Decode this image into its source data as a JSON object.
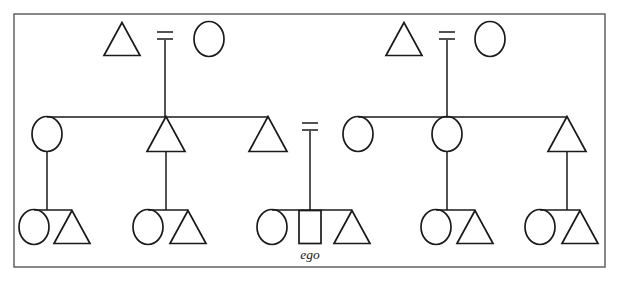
{
  "figure": {
    "type": "genealogical-kinship-chart",
    "background_color": "#ffffff",
    "ink_color": "#1a1a1a",
    "frame_color": "#58585a",
    "canvas": {
      "width": 619,
      "height": 281
    }
  },
  "frame": {
    "name": "figure-border",
    "x": 14,
    "y": 14,
    "width": 591,
    "height": 253
  },
  "legend_semantics": {
    "triangle": "male",
    "circle": "female",
    "square": "ego",
    "equals_sign": "marriage / union",
    "vertical_line": "descent",
    "horizontal_line": "sibling set"
  },
  "labels": [
    {
      "id": "ego-label",
      "text": "ego",
      "x": 310,
      "y": 259,
      "style": "italic-serif"
    }
  ],
  "generations": [
    {
      "id": "generation-1",
      "name": "grandparents-row",
      "baseline_y": 30,
      "shape_top_y": 22,
      "shape_bottom_y": 56
    },
    {
      "id": "generation-2",
      "name": "parents-row",
      "sibling_bar_y": 117,
      "shape_bottom_y": 152
    },
    {
      "id": "generation-3",
      "name": "ego-row",
      "sibling_bar_y": 210,
      "shape_bottom_y": 243
    }
  ],
  "nodes": [
    {
      "id": "n1",
      "shape": "triangle",
      "sex": "male",
      "generation": 1,
      "cx": 122,
      "cy": 39,
      "w": 36,
      "h": 33,
      "orientation": "up",
      "group": "left-ancestors"
    },
    {
      "id": "n2",
      "shape": "circle",
      "sex": "female",
      "generation": 1,
      "cx": 209,
      "cy": 39,
      "w": 30,
      "h": 35,
      "orientation": "none",
      "group": "left-ancestors"
    },
    {
      "id": "n3",
      "shape": "triangle",
      "sex": "male",
      "generation": 1,
      "cx": 404,
      "cy": 39,
      "w": 36,
      "h": 33,
      "orientation": "up",
      "group": "right-ancestors"
    },
    {
      "id": "n4",
      "shape": "circle",
      "sex": "female",
      "generation": 1,
      "cx": 490,
      "cy": 39,
      "w": 30,
      "h": 35,
      "orientation": "none",
      "group": "right-ancestors"
    },
    {
      "id": "n5",
      "shape": "circle",
      "sex": "female",
      "generation": 2,
      "cx": 47,
      "cy": 134,
      "w": 30,
      "h": 35,
      "orientation": "none",
      "group": "left-parents"
    },
    {
      "id": "n6",
      "shape": "triangle",
      "sex": "male",
      "generation": 2,
      "cx": 166,
      "cy": 134,
      "w": 38,
      "h": 35,
      "orientation": "down",
      "group": "left-parents"
    },
    {
      "id": "n7",
      "shape": "triangle",
      "sex": "male",
      "generation": 2,
      "cx": 268,
      "cy": 134,
      "w": 38,
      "h": 35,
      "orientation": "down",
      "group": "left-parents"
    },
    {
      "id": "n8",
      "shape": "circle",
      "sex": "female",
      "generation": 2,
      "cx": 358,
      "cy": 134,
      "w": 30,
      "h": 35,
      "orientation": "none",
      "group": "right-parents"
    },
    {
      "id": "n9",
      "shape": "circle",
      "sex": "female",
      "generation": 2,
      "cx": 447,
      "cy": 134,
      "w": 30,
      "h": 35,
      "orientation": "none",
      "group": "right-parents"
    },
    {
      "id": "n10",
      "shape": "triangle",
      "sex": "male",
      "generation": 2,
      "cx": 567,
      "cy": 134,
      "w": 38,
      "h": 35,
      "orientation": "down",
      "group": "right-parents"
    },
    {
      "id": "n11",
      "shape": "circle",
      "sex": "female",
      "generation": 3,
      "cx": 34,
      "cy": 227,
      "w": 30,
      "h": 35,
      "orientation": "none",
      "group": "cousins-1"
    },
    {
      "id": "n12",
      "shape": "triangle",
      "sex": "male",
      "generation": 3,
      "cx": 72,
      "cy": 227,
      "w": 36,
      "h": 33,
      "orientation": "up",
      "group": "cousins-1"
    },
    {
      "id": "n13",
      "shape": "circle",
      "sex": "female",
      "generation": 3,
      "cx": 148,
      "cy": 227,
      "w": 30,
      "h": 35,
      "orientation": "none",
      "group": "siblings-1"
    },
    {
      "id": "n14",
      "shape": "triangle",
      "sex": "male",
      "generation": 3,
      "cx": 188,
      "cy": 227,
      "w": 36,
      "h": 33,
      "orientation": "up",
      "group": "siblings-1"
    },
    {
      "id": "n15",
      "shape": "circle",
      "sex": "female",
      "generation": 3,
      "cx": 272,
      "cy": 227,
      "w": 30,
      "h": 35,
      "orientation": "none",
      "group": "ego-siblings"
    },
    {
      "id": "n16",
      "shape": "square",
      "sex": "ego",
      "generation": 3,
      "cx": 310,
      "cy": 227,
      "w": 22,
      "h": 33,
      "orientation": "none",
      "group": "ego-siblings"
    },
    {
      "id": "n17",
      "shape": "triangle",
      "sex": "male",
      "generation": 3,
      "cx": 352,
      "cy": 227,
      "w": 36,
      "h": 33,
      "orientation": "up",
      "group": "ego-siblings"
    },
    {
      "id": "n18",
      "shape": "circle",
      "sex": "female",
      "generation": 3,
      "cx": 436,
      "cy": 227,
      "w": 30,
      "h": 35,
      "orientation": "none",
      "group": "cousins-2"
    },
    {
      "id": "n19",
      "shape": "triangle",
      "sex": "male",
      "generation": 3,
      "cx": 475,
      "cy": 227,
      "w": 36,
      "h": 33,
      "orientation": "up",
      "group": "cousins-2"
    },
    {
      "id": "n20",
      "shape": "circle",
      "sex": "female",
      "generation": 3,
      "cx": 540,
      "cy": 227,
      "w": 30,
      "h": 35,
      "orientation": "none",
      "group": "cousins-3"
    },
    {
      "id": "n21",
      "shape": "triangle",
      "sex": "male",
      "generation": 3,
      "cx": 580,
      "cy": 227,
      "w": 36,
      "h": 33,
      "orientation": "up",
      "group": "cousins-3"
    }
  ],
  "marriages": [
    {
      "id": "m1",
      "name": "marriage-left-ancestors",
      "cx": 165,
      "y_top": 32,
      "y_bottom": 39,
      "bar_half_width": 8
    },
    {
      "id": "m2",
      "name": "marriage-right-ancestors",
      "cx": 447,
      "y_top": 32,
      "y_bottom": 39,
      "bar_half_width": 8
    },
    {
      "id": "m3",
      "name": "marriage-ego-parents",
      "cx": 310,
      "y_top": 123,
      "y_bottom": 130,
      "bar_half_width": 8
    }
  ],
  "descent_lines": [
    {
      "id": "d1",
      "name": "descent-left-ancestors-to-parents",
      "x": 165,
      "y1": 40,
      "y2": 117
    },
    {
      "id": "d2",
      "name": "descent-right-ancestors-to-parents",
      "x": 447,
      "y1": 40,
      "y2": 117
    },
    {
      "id": "d3",
      "name": "descent-ego-parents-to-ego-row",
      "x": 310,
      "y1": 131,
      "y2": 210
    },
    {
      "id": "d4",
      "name": "descent-aunt-left-to-cousins-1",
      "x": 47,
      "y1": 152,
      "y2": 210
    },
    {
      "id": "d5",
      "name": "descent-uncle-left-to-siblings-1",
      "x": 166,
      "y1": 152,
      "y2": 210
    },
    {
      "id": "d6",
      "name": "descent-aunt-right-to-cousins-2",
      "x": 447,
      "y1": 152,
      "y2": 210
    },
    {
      "id": "d7",
      "name": "descent-uncle-right-to-cousins-3",
      "x": 567,
      "y1": 152,
      "y2": 210
    }
  ],
  "sibling_bars": [
    {
      "id": "s1",
      "name": "sibling-bar-left-parents",
      "y": 117,
      "x1": 47,
      "x2": 268
    },
    {
      "id": "s2",
      "name": "sibling-bar-right-parents",
      "y": 117,
      "x1": 358,
      "x2": 567
    },
    {
      "id": "s3",
      "name": "sibling-bar-cousins-1",
      "y": 210,
      "x1": 34,
      "x2": 72
    },
    {
      "id": "s4",
      "name": "sibling-bar-siblings-1",
      "y": 210,
      "x1": 148,
      "x2": 188
    },
    {
      "id": "s5",
      "name": "sibling-bar-ego-siblings",
      "y": 210,
      "x1": 272,
      "x2": 352
    },
    {
      "id": "s6",
      "name": "sibling-bar-cousins-2",
      "y": 210,
      "x1": 436,
      "x2": 475
    },
    {
      "id": "s7",
      "name": "sibling-bar-cousins-3",
      "y": 210,
      "x1": 540,
      "x2": 580
    }
  ]
}
